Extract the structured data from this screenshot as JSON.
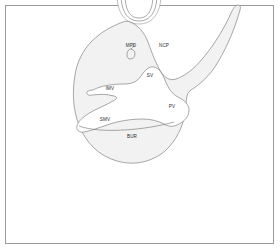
{
  "figure": {
    "border_color": "#9a9a9a",
    "background_color": "#ffffff",
    "organ_fill_color": "#f2f2f2",
    "outline_color": "#6e6e6e",
    "label_color": "#2b2b2b"
  },
  "labels": [
    {
      "id": "mpd",
      "text": "MPD",
      "x": 131,
      "y": 46,
      "name": "label-mpd"
    },
    {
      "id": "ncp",
      "text": "NCP",
      "x": 164,
      "y": 46,
      "name": "label-ncp"
    },
    {
      "id": "sv",
      "text": "SV",
      "x": 150,
      "y": 76,
      "name": "label-sv"
    },
    {
      "id": "imv",
      "text": "IMV",
      "x": 110,
      "y": 89,
      "name": "label-imv"
    },
    {
      "id": "smv",
      "text": "SMV",
      "x": 105,
      "y": 120,
      "name": "label-smv"
    },
    {
      "id": "pv",
      "text": "PV",
      "x": 172,
      "y": 107,
      "name": "label-pv"
    },
    {
      "id": "bur",
      "text": "BUR",
      "x": 132,
      "y": 137,
      "name": "label-bur"
    }
  ],
  "structures": [
    {
      "id": "duodenum-arc",
      "name": "duodenum-arc-shape"
    },
    {
      "id": "pancreas-body",
      "name": "pancreas-body-shape"
    },
    {
      "id": "splenic-vein",
      "name": "splenic-vein-shape"
    },
    {
      "id": "main-pancreatic-duct",
      "name": "main-pancreatic-duct-shape"
    },
    {
      "id": "lower-lobe",
      "name": "lower-lobe-shape"
    }
  ]
}
